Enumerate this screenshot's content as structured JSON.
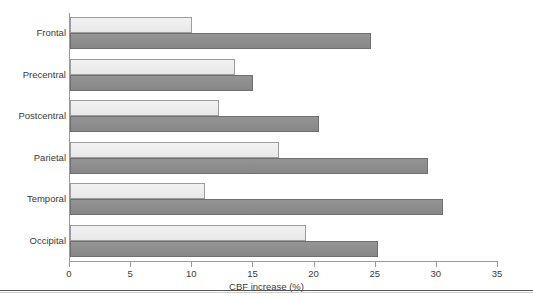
{
  "chart_data": {
    "type": "bar",
    "orientation": "horizontal",
    "title": "",
    "xlabel": "CBF increase (%)",
    "ylabel": "",
    "xlim": [
      0,
      35
    ],
    "xticks": [
      0,
      5,
      10,
      15,
      20,
      25,
      30,
      35
    ],
    "xtick_labels": [
      "0",
      "5",
      "10",
      "15",
      "20",
      "25",
      "30",
      "35"
    ],
    "grid": false,
    "legend": "none",
    "categories": [
      "Frontal",
      "Precentral",
      "Postcentral",
      "Parietal",
      "Temporal",
      "Occipital"
    ],
    "series": [
      {
        "name": "light",
        "color": "#ededed",
        "values": [
          10.0,
          13.5,
          12.2,
          17.1,
          11.0,
          19.3
        ]
      },
      {
        "name": "dark",
        "color": "#8c8c8c",
        "values": [
          24.6,
          15.0,
          20.4,
          29.3,
          30.5,
          25.2
        ]
      }
    ]
  },
  "axis": {
    "x_label": "CBF increase (%)",
    "tick_labels": [
      "0",
      "5",
      "10",
      "15",
      "20",
      "25",
      "30",
      "35"
    ]
  },
  "categories": [
    {
      "label": "Frontal"
    },
    {
      "label": "Precentral"
    },
    {
      "label": "Postcentral"
    },
    {
      "label": "Parietal"
    },
    {
      "label": "Temporal"
    },
    {
      "label": "Occipital"
    }
  ],
  "colors": {
    "light_bar": "#ededed",
    "light_bar_border": "#9d9d9d",
    "dark_bar": "#8c8c8c",
    "dark_bar_border": "#6f6f6f",
    "axis": "#9a9a9a",
    "text": "#3a3a3a",
    "rule": "#555555"
  }
}
